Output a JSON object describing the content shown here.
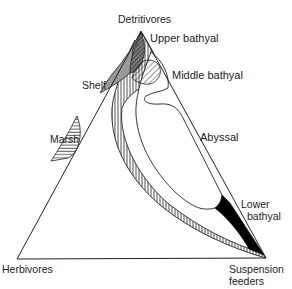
{
  "diagram": {
    "type": "ternary",
    "vertices": {
      "top": "Detritivores",
      "bottom_left": "Herbivores",
      "bottom_right_line1": "Suspension",
      "bottom_right_line2": "feeders"
    },
    "regions": [
      {
        "id": "upper-bathyal",
        "label": "Upper bathyal",
        "fill": "vertical-hatch"
      },
      {
        "id": "shelf",
        "label": "Shelf",
        "fill": "grey-stipple"
      },
      {
        "id": "middle-bathyal",
        "label": "Middle bathyal",
        "fill": "diagonal-hatch"
      },
      {
        "id": "marsh",
        "label": "Marsh",
        "fill": "horizontal-hatch"
      },
      {
        "id": "abyssal",
        "label": "Abyssal",
        "fill": "white"
      },
      {
        "id": "lower-bathyal-line1",
        "label": "Lower"
      },
      {
        "id": "lower-bathyal-line2",
        "label": "bathyal",
        "fill": "black"
      }
    ],
    "colors": {
      "line": "#222222",
      "shelf_grey": "#9a9a9a",
      "dark_overlap": "#555555",
      "lower_bathyal": "#000000"
    }
  }
}
